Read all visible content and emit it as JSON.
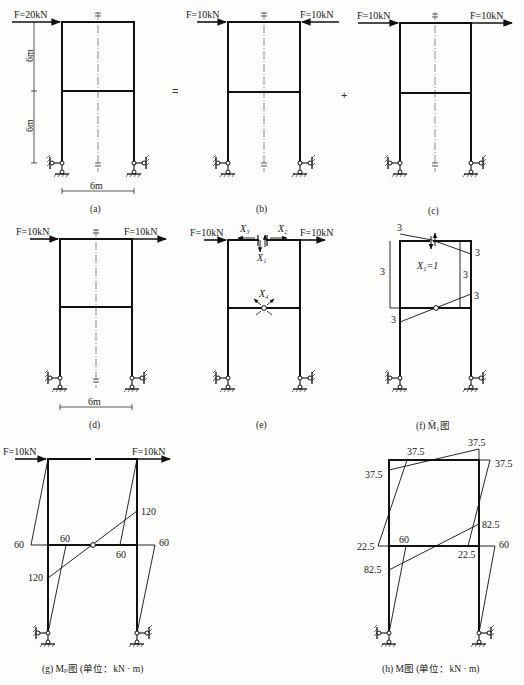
{
  "figure": {
    "operators": {
      "equals": "=",
      "plus": "+"
    },
    "panels": {
      "a": {
        "caption": "(a)",
        "force_left": "F=20kN",
        "dim_upper": "6m",
        "dim_lower": "6m",
        "dim_width": "6m"
      },
      "b": {
        "caption": "(b)",
        "force_left": "F=10kN",
        "force_right": "F=10kN"
      },
      "c": {
        "caption": "(c)",
        "force_left": "F=10kN",
        "force_right": "F=10kN"
      },
      "d": {
        "caption": "(d)",
        "force_left": "F=10kN",
        "force_right": "F=10kN",
        "dim_width": "6m"
      },
      "e": {
        "caption": "(e)",
        "force_left": "F=10kN",
        "force_right": "F=10kN",
        "unknowns": {
          "x1": "X₁",
          "x2": "X₂",
          "x3": "X₃",
          "x4": "X₄"
        }
      },
      "f": {
        "caption": "(f) M̄₁图",
        "unit_load": "X₁=1",
        "values": {
          "top_left": "3",
          "top_right": "3",
          "left_col": "3",
          "right_col": "3",
          "beam_right": "3",
          "beam_left": "3"
        }
      },
      "g": {
        "caption": "(g) Mₚ图 (单位：kN · m)",
        "force_left": "F=10kN",
        "force_right": "F=10kN",
        "values": {
          "left_joint": "60",
          "left_beam": "60",
          "right_beam": "60",
          "right_joint": "60",
          "right_col_upper": "120",
          "left_col_lower": "120"
        }
      },
      "h": {
        "caption": "(h) M图 (单位：kN · m)",
        "values": {
          "top_right_peak": "37.5",
          "top_left_beam": "37.5",
          "top_left_col": "37.5",
          "top_right_col": "37.5",
          "mid_left_outer": "22.5",
          "mid_left_beam": "60",
          "mid_right_beam": "22.5",
          "mid_right_outer": "60",
          "right_col_lower": "82.5",
          "left_col_lower": "82.5"
        }
      }
    }
  }
}
